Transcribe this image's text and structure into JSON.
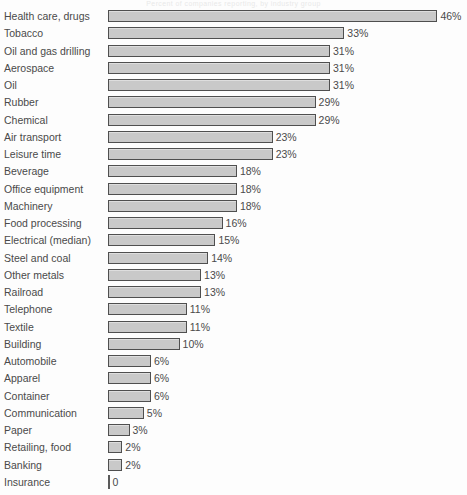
{
  "title_strip": "Percent of companies reporting, by industry group",
  "axis": {
    "origin_label": "0",
    "unit_suffix": "%"
  },
  "colors": {
    "bar_fill": "#c9c9c9",
    "bar_border": "#4f4f4f",
    "text": "#4a4a4a",
    "background": "#fdfdfd"
  },
  "chart_data": {
    "type": "bar",
    "orientation": "horizontal",
    "title": "",
    "xlabel": "",
    "ylabel": "",
    "xlim": [
      0,
      46
    ],
    "grid": false,
    "legend": null,
    "value_suffix": "%",
    "categories": [
      "Health care, drugs",
      "Tobacco",
      "Oil and gas drilling",
      "Aerospace",
      "Oil",
      "Rubber",
      "Chemical",
      "Air transport",
      "Leisure time",
      "Beverage",
      "Office equipment",
      "Machinery",
      "Food processing",
      "Electrical (median)",
      "Steel and coal",
      "Other metals",
      "Railroad",
      "Telephone",
      "Textile",
      "Building",
      "Automobile",
      "Apparel",
      "Container",
      "Communication",
      "Paper",
      "Retailing, food",
      "Banking",
      "Insurance"
    ],
    "values": [
      46,
      33,
      31,
      31,
      31,
      29,
      29,
      23,
      23,
      18,
      18,
      18,
      16,
      15,
      14,
      13,
      13,
      11,
      11,
      10,
      6,
      6,
      6,
      5,
      3,
      2,
      2,
      0
    ],
    "data_labels": [
      "46%",
      "33%",
      "31%",
      "31%",
      "31%",
      "29%",
      "29%",
      "23%",
      "23%",
      "18%",
      "18%",
      "18%",
      "16%",
      "15%",
      "14%",
      "13%",
      "13%",
      "11%",
      "11%",
      "10%",
      "6%",
      "6%",
      "6%",
      "5%",
      "3%",
      "2%",
      "2%",
      "0"
    ]
  }
}
